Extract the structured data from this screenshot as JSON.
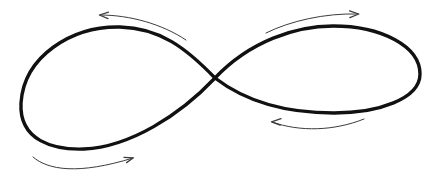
{
  "figure": {
    "title": "Figure-eight (lemniscate) curve with direction-of-travel arrows",
    "width": 441,
    "height": 184,
    "background_color": "#ffffff"
  },
  "curve": {
    "name": "lemniscate",
    "stroke_color": "#111111",
    "stroke_width": 3.4,
    "crossing_point": {
      "x": 215,
      "y": 78
    },
    "left_lobe": {
      "leftmost_x": 21,
      "top_y": 27,
      "bottom_y": 149,
      "top_apex_x": 110,
      "bottom_apex_x": 82,
      "extreme_y": 105
    },
    "right_lobe": {
      "rightmost_x": 420,
      "top_y": 26,
      "bottom_y": 113,
      "top_apex_x": 337,
      "bottom_apex_x": 330,
      "tip_y": 75
    },
    "path": "M 215 78 C 186 48 160 28 120 27 C 72 26 24 56 21 103 C 19 141 54 150 84 149 C 130 147 180 115 215 78 C 250 41 296 26 333 26 C 381 26 420 46 420 74 C 420 99 378 113 334 113 C 283 113 245 101 215 78 Z"
  },
  "arrows": [
    {
      "id": "arrow-top-left",
      "label": "top-left direction arrow",
      "points": "left",
      "color": "#3c3c3c",
      "stroke_width": 1.0,
      "path": "M 100 15 C 130 15 162 24 186 40",
      "head_at": {
        "x": 100,
        "y": 15
      }
    },
    {
      "id": "arrow-top-right",
      "label": "top-right direction arrow",
      "points": "right",
      "color": "#3c3c3c",
      "stroke_width": 1.0,
      "path": "M 266 33 C 290 21 325 13 358 14",
      "head_at": {
        "x": 358,
        "y": 14
      }
    },
    {
      "id": "arrow-bottom-left",
      "label": "bottom-left direction arrow",
      "points": "right",
      "color": "#3c3c3c",
      "stroke_width": 1.0,
      "path": "M 33 157 C 48 170 78 175 133 158",
      "head_at": {
        "x": 133,
        "y": 158
      }
    },
    {
      "id": "arrow-bottom-right",
      "label": "bottom-right direction arrow",
      "points": "left",
      "color": "#3c3c3c",
      "stroke_width": 1.0,
      "path": "M 272 122 C 300 132 334 131 364 119",
      "head_at": {
        "x": 272,
        "y": 122
      }
    }
  ],
  "legend": {
    "left_lobe_rotation": "counterclockwise",
    "right_lobe_rotation": "clockwise"
  }
}
